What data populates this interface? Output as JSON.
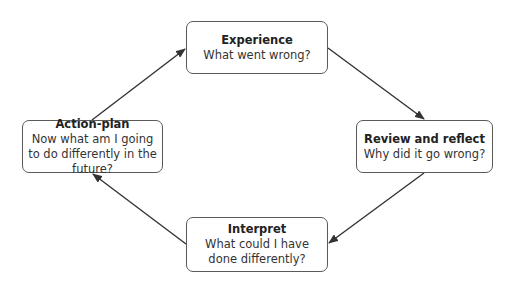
{
  "diagram": {
    "type": "cycle",
    "nodes": [
      {
        "id": "experience",
        "title": "Experience",
        "text": "What went wrong?"
      },
      {
        "id": "review",
        "title": "Review and reflect",
        "text": "Why did it go wrong?"
      },
      {
        "id": "interpret",
        "title": "Interpret",
        "text": "What could I have done differently?"
      },
      {
        "id": "action",
        "title": "Action-plan",
        "text": "Now what am I going to do differently in the future?"
      }
    ],
    "edges": [
      {
        "from": "experience",
        "to": "review"
      },
      {
        "from": "review",
        "to": "interpret"
      },
      {
        "from": "interpret",
        "to": "action"
      },
      {
        "from": "action",
        "to": "experience"
      }
    ],
    "colors": {
      "border": "#5a5a5a",
      "arrow": "#333333",
      "background": "#ffffff"
    }
  }
}
